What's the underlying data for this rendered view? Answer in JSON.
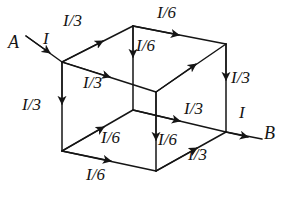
{
  "figure": {
    "type": "physics-circuit-diagram",
    "background_color": "#ffffff",
    "stroke_color": "#151515",
    "caption": ""
  },
  "nodes": [
    {
      "id": "A",
      "label": "A",
      "x": 14,
      "y": 44
    },
    {
      "id": "B",
      "label": "B",
      "x": 268,
      "y": 135
    }
  ],
  "labels": [
    {
      "id": "lead-in-current",
      "text": "I",
      "x": 47,
      "y": 41,
      "edge": "external lead into A corner"
    },
    {
      "id": "top-left-front-edge",
      "text": "I/3",
      "x": 72,
      "y": 22,
      "edge": "front-top-left to back-top-left"
    },
    {
      "id": "top-back-edge",
      "text": "I/6",
      "x": 168,
      "y": 13,
      "edge": "back-top-left to back-top-right"
    },
    {
      "id": "top-vertical-edge",
      "text": "I/6",
      "x": 143,
      "y": 45,
      "edge": "back-top-left down to inner vertex"
    },
    {
      "id": "front-top-right-edge",
      "text": "I/3",
      "x": 92,
      "y": 83,
      "edge": "front-top-left to front-top-right"
    },
    {
      "id": "right-vertical-edge",
      "text": "I/3",
      "x": 238,
      "y": 78,
      "edge": "back-top-right down to B"
    },
    {
      "id": "left-vertical-edge",
      "text": "I/3",
      "x": 31,
      "y": 105,
      "edge": "front-top-left down to front-bottom-left"
    },
    {
      "id": "mid-right-edge",
      "text": "I/3",
      "x": 193,
      "y": 110,
      "edge": "inner bottom vertex to B"
    },
    {
      "id": "exit-current",
      "text": "I",
      "x": 242,
      "y": 114,
      "edge": "external lead out of B corner"
    },
    {
      "id": "bottom-left-diag",
      "text": "I/6",
      "x": 110,
      "y": 138,
      "edge": "front-bottom-left to inner bottom vertex"
    },
    {
      "id": "bottom-vertical-edge",
      "text": "I/6",
      "x": 163,
      "y": 140,
      "edge": "inner vertex down to front-bottom-right"
    },
    {
      "id": "bottom-front-edge",
      "text": "I/6",
      "x": 95,
      "y": 175,
      "edge": "front-bottom-left to front-bottom-right"
    },
    {
      "id": "bottom-right-diag",
      "text": "I/3",
      "x": 196,
      "y": 155,
      "edge": "front-bottom-right up to B"
    }
  ]
}
